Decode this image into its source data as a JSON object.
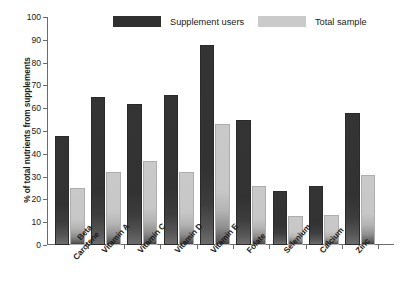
{
  "chart_data": {
    "type": "bar",
    "title": "",
    "xlabel": "",
    "ylabel": "% of total nutrients from supplements",
    "ylim": [
      0,
      100
    ],
    "ytick_values": [
      0,
      10,
      20,
      30,
      40,
      50,
      60,
      70,
      80,
      90,
      100
    ],
    "ytick_labels": [
      "0",
      "10",
      "20",
      "30",
      "40",
      "50",
      "60",
      "70",
      "80",
      "90",
      "100"
    ],
    "grid": false,
    "legend_position": "top",
    "categories": [
      "Beta\nCarotene",
      "Vitamin A",
      "Vitamin C",
      "Vitamin D",
      "Vitamin E",
      "Folate",
      "Selenium",
      "Calcium",
      "Zinc"
    ],
    "series": [
      {
        "name": "Supplement users",
        "color": "#303030",
        "values": [
          47,
          64,
          61,
          65,
          87,
          54,
          23,
          25,
          57
        ]
      },
      {
        "name": "Total sample",
        "color": "#cacaca",
        "values": [
          24,
          31,
          36,
          31,
          52,
          25,
          12,
          12.5,
          30
        ]
      }
    ]
  },
  "legend": {
    "items": [
      {
        "label": "Supplement users",
        "swatch": "dark"
      },
      {
        "label": "Total sample",
        "swatch": "light"
      }
    ]
  },
  "colors": {
    "series_dark": "#303030",
    "series_light": "#cacaca",
    "axis": "#6b6b6b",
    "text": "#1a1a1a",
    "background": "#ffffff"
  }
}
